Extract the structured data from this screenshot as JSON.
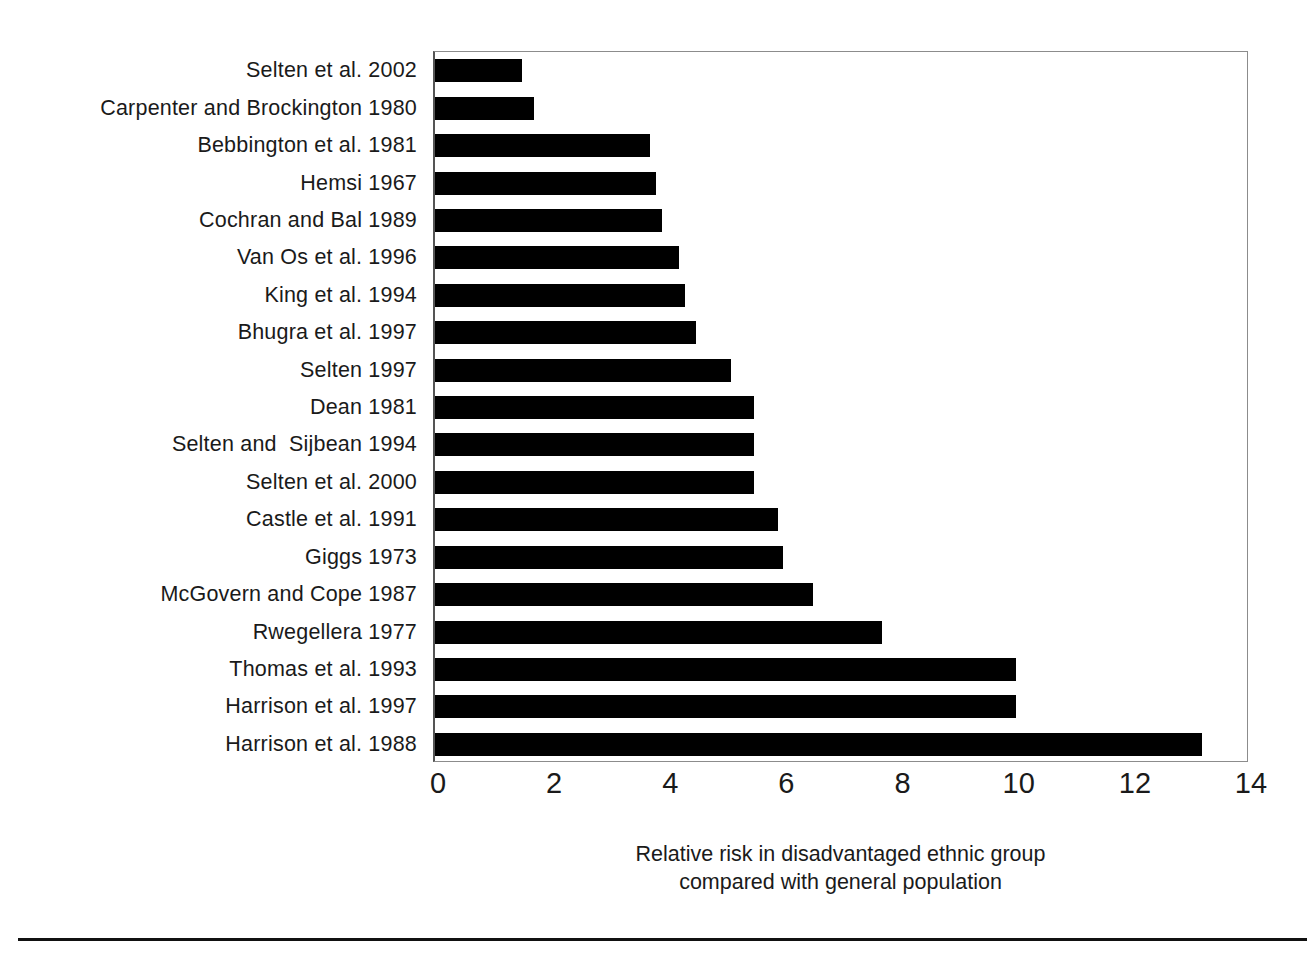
{
  "chart_data": {
    "type": "bar",
    "orientation": "horizontal",
    "title": "",
    "subtitle": "",
    "xlabel": "Relative risk in disadvantaged ethnic group compared with general population",
    "xlabel_lines": [
      "Relative risk in disadvantaged ethnic group",
      "compared with general population"
    ],
    "ylabel": "",
    "categories": [
      "Selten et al. 2002",
      "Carpenter and Brockington 1980",
      "Bebbington et al. 1981",
      "Hemsi 1967",
      "Cochran and Bal 1989",
      "Van Os et al. 1996",
      "King et al. 1994",
      "Bhugra et al. 1997",
      "Selten 1997",
      "Dean 1981",
      "Selten and  Sijbean 1994",
      "Selten et al. 2000",
      "Castle et al. 1991",
      "Giggs 1973",
      "McGovern and Cope 1987",
      "Rwegellera 1977",
      "Thomas et al. 1993",
      "Harrison et al. 1997",
      "Harrison et al. 1988"
    ],
    "values": [
      1.5,
      1.7,
      3.7,
      3.8,
      3.9,
      4.2,
      4.3,
      4.5,
      5.1,
      5.5,
      5.5,
      5.5,
      5.9,
      6.0,
      6.5,
      7.7,
      10.0,
      10.0,
      13.2
    ],
    "xlim": [
      0,
      14
    ],
    "xticks": [
      0,
      2,
      4,
      6,
      8,
      10,
      12,
      14
    ],
    "xtick_labels": [
      "0",
      "2",
      "4",
      "6",
      "8",
      "10",
      "12",
      "14"
    ],
    "grid": false,
    "legend": null,
    "legend_position": "none",
    "bar_color": "#000000",
    "plot_border_color": "#8c8c8c",
    "axis_color": "#555555",
    "background_color": "#ffffff",
    "text_color": "#1a1a1a"
  },
  "figure": {
    "bottom_rule_color": "#111111"
  }
}
